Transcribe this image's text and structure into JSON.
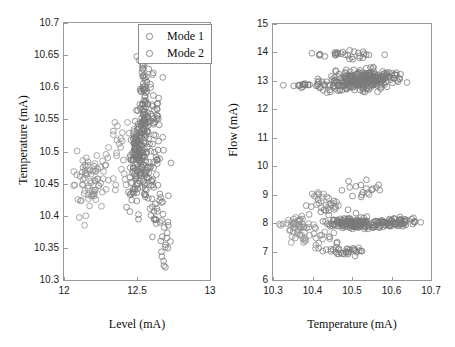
{
  "figure": {
    "background": "#ffffff",
    "marker_color_mode1": "#7a7a7a",
    "marker_color_mode2": "#8f8f8f",
    "axis_color": "#9a9a9a"
  },
  "legend": {
    "marker_icon": "open-circle",
    "entries": [
      {
        "label": "Mode 1",
        "color": "#7a7a7a"
      },
      {
        "label": "Mode 2",
        "color": "#8f8f8f"
      }
    ]
  },
  "chart_data": [
    {
      "id": "left",
      "type": "scatter",
      "title": "",
      "xlabel": "Level (mA)",
      "ylabel": "Temperature (mA)",
      "xlim": [
        12,
        13
      ],
      "ylim": [
        10.3,
        10.7
      ],
      "xticks": [
        12,
        12.5,
        13
      ],
      "xticklabels": [
        "12",
        "12.5",
        "13"
      ],
      "yticks": [
        10.3,
        10.35,
        10.4,
        10.45,
        10.5,
        10.55,
        10.6,
        10.65,
        10.7
      ],
      "yticklabels": [
        "10.3",
        "10.35",
        "10.4",
        "10.45",
        "10.5",
        "10.55",
        "10.6",
        "10.65",
        "10.7"
      ],
      "grid": false,
      "legend_position": "top-right",
      "series": [
        {
          "name": "Mode 1",
          "color": "#7a7a7a",
          "marker": "o",
          "clusters": [
            {
              "n": 150,
              "cx": 12.52,
              "cy": 10.53,
              "sx": 0.022,
              "sy": 0.045,
              "rot": -0.3
            },
            {
              "n": 90,
              "cx": 12.55,
              "cy": 10.5,
              "sx": 0.03,
              "sy": 0.05,
              "rot": -0.45
            },
            {
              "n": 55,
              "cx": 12.58,
              "cy": 10.46,
              "sx": 0.035,
              "sy": 0.038,
              "rot": -0.55
            },
            {
              "n": 30,
              "cx": 12.54,
              "cy": 10.62,
              "sx": 0.016,
              "sy": 0.028,
              "rot": 0.05
            },
            {
              "n": 22,
              "cx": 12.64,
              "cy": 10.4,
              "sx": 0.028,
              "sy": 0.028,
              "rot": -0.4
            },
            {
              "n": 14,
              "cx": 12.7,
              "cy": 10.35,
              "sx": 0.018,
              "sy": 0.02,
              "rot": -0.3
            }
          ]
        },
        {
          "name": "Mode 2",
          "color": "#8f8f8f",
          "marker": "o",
          "clusters": [
            {
              "n": 40,
              "cx": 12.18,
              "cy": 10.46,
              "sx": 0.06,
              "sy": 0.022,
              "rot": 0.1
            },
            {
              "n": 30,
              "cx": 12.3,
              "cy": 10.47,
              "sx": 0.075,
              "sy": 0.025,
              "rot": 0.05
            },
            {
              "n": 18,
              "cx": 12.12,
              "cy": 10.44,
              "sx": 0.04,
              "sy": 0.03,
              "rot": 0.0
            },
            {
              "n": 14,
              "cx": 12.4,
              "cy": 10.52,
              "sx": 0.055,
              "sy": 0.02,
              "rot": 0.05
            }
          ]
        }
      ]
    },
    {
      "id": "right",
      "type": "scatter",
      "title": "",
      "xlabel": "Temperature (mA)",
      "ylabel": "Flow (mA)",
      "xlim": [
        10.3,
        10.7
      ],
      "ylim": [
        6,
        15
      ],
      "xticks": [
        10.3,
        10.4,
        10.5,
        10.6,
        10.7
      ],
      "xticklabels": [
        "10.3",
        "10.4",
        "10.5",
        "10.6",
        "10.7"
      ],
      "yticks": [
        6,
        7,
        8,
        9,
        10,
        11,
        12,
        13,
        14,
        15
      ],
      "yticklabels": [
        "6",
        "7",
        "8",
        "9",
        "10",
        "11",
        "12",
        "13",
        "14",
        "15"
      ],
      "grid": false,
      "legend_position": "none",
      "series": [
        {
          "name": "Mode 1",
          "color": "#7a7a7a",
          "marker": "o",
          "clusters": [
            {
              "n": 150,
              "cx": 10.53,
              "cy": 13.05,
              "sx": 0.03,
              "sy": 0.16,
              "rot": 0.0
            },
            {
              "n": 80,
              "cx": 10.5,
              "cy": 12.95,
              "sx": 0.04,
              "sy": 0.18,
              "rot": 0.05
            },
            {
              "n": 45,
              "cx": 10.57,
              "cy": 13.1,
              "sx": 0.035,
              "sy": 0.18,
              "rot": 0.0
            },
            {
              "n": 30,
              "cx": 10.5,
              "cy": 13.92,
              "sx": 0.04,
              "sy": 0.08,
              "rot": 0.0
            },
            {
              "n": 20,
              "cx": 10.44,
              "cy": 12.88,
              "sx": 0.035,
              "sy": 0.09,
              "rot": 0.0
            },
            {
              "n": 14,
              "cx": 10.38,
              "cy": 12.85,
              "sx": 0.022,
              "sy": 0.04,
              "rot": 0.0
            },
            {
              "n": 120,
              "cx": 10.5,
              "cy": 7.98,
              "sx": 0.026,
              "sy": 0.09,
              "rot": 0.0
            },
            {
              "n": 60,
              "cx": 10.56,
              "cy": 8.0,
              "sx": 0.04,
              "sy": 0.1,
              "rot": 0.0
            },
            {
              "n": 40,
              "cx": 10.62,
              "cy": 8.03,
              "sx": 0.025,
              "sy": 0.07,
              "rot": 0.0
            },
            {
              "n": 35,
              "cx": 10.48,
              "cy": 7.05,
              "sx": 0.03,
              "sy": 0.1,
              "rot": 0.0
            },
            {
              "n": 20,
              "cx": 10.44,
              "cy": 8.55,
              "sx": 0.025,
              "sy": 0.22,
              "rot": 0.0
            },
            {
              "n": 18,
              "cx": 10.52,
              "cy": 9.2,
              "sx": 0.028,
              "sy": 0.2,
              "rot": 0.0
            }
          ]
        },
        {
          "name": "Mode 2",
          "color": "#8f8f8f",
          "marker": "o",
          "clusters": [
            {
              "n": 30,
              "cx": 10.35,
              "cy": 7.95,
              "sx": 0.022,
              "sy": 0.12,
              "rot": 0.0
            },
            {
              "n": 22,
              "cx": 10.4,
              "cy": 7.6,
              "sx": 0.025,
              "sy": 0.22,
              "rot": 0.0
            },
            {
              "n": 16,
              "cx": 10.42,
              "cy": 8.9,
              "sx": 0.02,
              "sy": 0.2,
              "rot": 0.0
            },
            {
              "n": 14,
              "cx": 10.37,
              "cy": 7.45,
              "sx": 0.018,
              "sy": 0.18,
              "rot": 0.0
            }
          ]
        }
      ]
    }
  ]
}
